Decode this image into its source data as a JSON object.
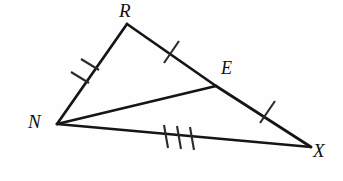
{
  "figure": {
    "kind": "geometry-diagram",
    "canvas": {
      "width": 343,
      "height": 181
    },
    "background_color": "#fefefe",
    "stroke_color": "#151515",
    "tick_color": "#2b2b2b",
    "vertices": [
      {
        "name": "R",
        "label": "R",
        "x": 127,
        "y": 24,
        "label_x": 119,
        "label_y": 1
      },
      {
        "name": "N",
        "label": "N",
        "x": 57,
        "y": 124,
        "label_x": 28,
        "label_y": 112
      },
      {
        "name": "E",
        "label": "E",
        "x": 216,
        "y": 86,
        "label_x": 221,
        "label_y": 59
      },
      {
        "name": "X",
        "label": "X",
        "x": 311,
        "y": 147,
        "label_x": 313,
        "label_y": 141
      }
    ],
    "segments": [
      {
        "name": "segment-NR",
        "from": "N",
        "to": "R",
        "x1": 57,
        "y1": 124,
        "x2": 127,
        "y2": 24,
        "width": 2.6,
        "ticks": 2
      },
      {
        "name": "segment-RE",
        "from": "R",
        "to": "E",
        "x1": 127,
        "y1": 24,
        "x2": 216,
        "y2": 86,
        "width": 2.6,
        "ticks": 1
      },
      {
        "name": "segment-EX",
        "from": "E",
        "to": "X",
        "x1": 216,
        "y1": 86,
        "x2": 311,
        "y2": 147,
        "width": 2.6,
        "ticks": 1
      },
      {
        "name": "segment-NX",
        "from": "N",
        "to": "X",
        "x1": 57,
        "y1": 124,
        "x2": 311,
        "y2": 147,
        "width": 2.6,
        "ticks": 3
      },
      {
        "name": "segment-NE",
        "from": "N",
        "to": "E",
        "x1": 57,
        "y1": 124,
        "x2": 216,
        "y2": 86,
        "width": 2.6,
        "ticks": 0
      }
    ],
    "tick_marks": [
      {
        "name": "tick-NR-1",
        "x1": 81,
        "y1": 60,
        "x2": 98,
        "y2": 69
      },
      {
        "name": "tick-NR-2",
        "x1": 72,
        "y1": 73,
        "x2": 89,
        "y2": 82
      },
      {
        "name": "tick-RE-1",
        "x1": 165,
        "y1": 62,
        "x2": 178,
        "y2": 42
      },
      {
        "name": "tick-EX-1",
        "x1": 261,
        "y1": 122,
        "x2": 274,
        "y2": 102
      },
      {
        "name": "tick-NX-1",
        "x1": 165,
        "y1": 126,
        "x2": 168,
        "y2": 147
      },
      {
        "name": "tick-NX-2",
        "x1": 178,
        "y1": 127,
        "x2": 181,
        "y2": 148
      },
      {
        "name": "tick-NX-3",
        "x1": 191,
        "y1": 128,
        "x2": 194,
        "y2": 149
      }
    ]
  }
}
